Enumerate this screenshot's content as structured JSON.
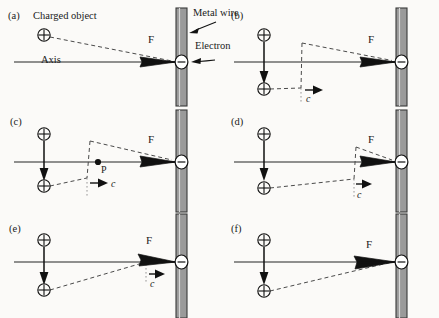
{
  "figure": {
    "background_color": "#fbfaf8",
    "ink_color": "#1a1a1a",
    "wire_fill_color": "#9a9a9a",
    "axis_color": "#6b6b6b"
  },
  "annotations": {
    "charged_object_label": "Charged object",
    "axis_label": "Axis",
    "metal_wire_label": "Metal wire",
    "electron_label": "Electron"
  },
  "symbols": {
    "positive_charge": "+",
    "electron_charge": "−",
    "force_label": "F",
    "speed_of_light_label": "c",
    "point_label": "P"
  },
  "panels": [
    {
      "id": "a",
      "letter": "(a)",
      "state": "charge-at-rest",
      "has_moving_charge": false,
      "has_kink": false,
      "has_c_arrow": false,
      "has_point_p": false,
      "force_label": "F",
      "charges": [
        {
          "type": "positive",
          "x": 44,
          "y": 35
        }
      ],
      "kink_x": null
    },
    {
      "id": "b",
      "letter": "(b)",
      "state": "charge-just-moved",
      "has_moving_charge": true,
      "has_kink": true,
      "has_c_arrow": true,
      "has_point_p": false,
      "force_label": "F",
      "speed_label": "c",
      "charges": [
        {
          "type": "positive",
          "x": 44,
          "y": 35
        },
        {
          "type": "positive",
          "x": 44,
          "y": 88
        }
      ],
      "kink_x": 82
    },
    {
      "id": "c",
      "letter": "(c)",
      "state": "kink-propagating-near",
      "has_moving_charge": true,
      "has_kink": true,
      "has_c_arrow": true,
      "has_point_p": true,
      "force_label": "F",
      "speed_label": "c",
      "point_label": "P",
      "charges": [
        {
          "type": "positive",
          "x": 44,
          "y": 28
        },
        {
          "type": "positive",
          "x": 44,
          "y": 80
        }
      ],
      "kink_x": 90
    },
    {
      "id": "d",
      "letter": "(d)",
      "state": "kink-propagating-mid",
      "has_moving_charge": true,
      "has_kink": true,
      "has_c_arrow": true,
      "has_point_p": false,
      "force_label": "F",
      "speed_label": "c",
      "charges": [
        {
          "type": "positive",
          "x": 44,
          "y": 28
        },
        {
          "type": "positive",
          "x": 44,
          "y": 80
        }
      ],
      "kink_x": 136
    },
    {
      "id": "e",
      "letter": "(e)",
      "state": "kink-reaching-electron",
      "has_moving_charge": true,
      "has_kink": true,
      "has_c_arrow": true,
      "has_point_p": false,
      "force_label": "F",
      "speed_label": "c",
      "charges": [
        {
          "type": "positive",
          "x": 44,
          "y": 28
        },
        {
          "type": "positive",
          "x": 44,
          "y": 80
        }
      ],
      "kink_x": 146
    },
    {
      "id": "f",
      "letter": "(f)",
      "state": "kink-passed",
      "has_moving_charge": true,
      "has_kink": false,
      "has_c_arrow": false,
      "has_point_p": false,
      "force_label": "F",
      "charges": [
        {
          "type": "positive",
          "x": 44,
          "y": 28
        },
        {
          "type": "positive",
          "x": 44,
          "y": 80
        }
      ],
      "kink_x": null
    }
  ]
}
